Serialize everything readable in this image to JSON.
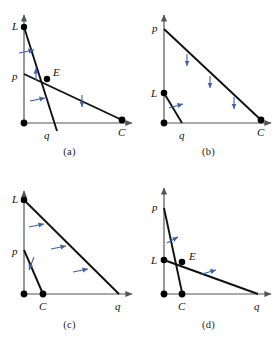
{
  "figure": {
    "type": "geometry-diagram-grid",
    "panel_count": 4,
    "colors": {
      "line": "#111111",
      "axis": "#555555",
      "arrow_marker": "#3f5fa8",
      "point": "#000000",
      "background": "#ffffff"
    }
  },
  "panels": [
    {
      "id": "a",
      "caption": "(a)",
      "labels": {
        "L": "L",
        "p": "p",
        "E": "E",
        "q": "q",
        "C": "C"
      },
      "points": [
        {
          "name": "origin",
          "x": 24,
          "y": 123
        },
        {
          "name": "L",
          "x": 24,
          "y": 27
        },
        {
          "name": "E",
          "x": 47,
          "y": 79
        },
        {
          "name": "C",
          "x": 122,
          "y": 120
        }
      ],
      "segments": [
        {
          "name": "L-q",
          "from": "L",
          "to": "q"
        },
        {
          "name": "p-C",
          "from": "p",
          "to": "C"
        }
      ],
      "axis": {
        "vertical": true,
        "horizontal": true
      },
      "marker_count": 4
    },
    {
      "id": "b",
      "caption": "(b)",
      "labels": {
        "p": "p",
        "L": "L",
        "q": "q",
        "C": "C"
      },
      "points": [
        {
          "name": "origin",
          "x": 25,
          "y": 123
        },
        {
          "name": "L",
          "x": 25,
          "y": 93
        },
        {
          "name": "C",
          "x": 122,
          "y": 120
        }
      ],
      "segments": [
        {
          "name": "p-C",
          "from": "p",
          "to": "C"
        },
        {
          "name": "L-q",
          "from": "L",
          "to": "q"
        }
      ],
      "axis": {
        "vertical": true,
        "horizontal": true
      },
      "marker_count": 4
    },
    {
      "id": "c",
      "caption": "(c)",
      "labels": {
        "L": "L",
        "p": "p",
        "C": "C",
        "q": "q"
      },
      "points": [
        {
          "name": "origin",
          "x": 24,
          "y": 121
        },
        {
          "name": "L",
          "x": 24,
          "y": 27
        },
        {
          "name": "C",
          "x": 43,
          "y": 121
        }
      ],
      "segments": [
        {
          "name": "L-q",
          "from": "L",
          "to": "q"
        },
        {
          "name": "p-C",
          "from": "p",
          "to": "C"
        }
      ],
      "axis": {
        "vertical": true,
        "horizontal": true
      },
      "marker_count": 4
    },
    {
      "id": "d",
      "caption": "(d)",
      "labels": {
        "p": "p",
        "L": "L",
        "E": "E",
        "C": "C",
        "q": "q"
      },
      "points": [
        {
          "name": "origin",
          "x": 25,
          "y": 121
        },
        {
          "name": "L",
          "x": 25,
          "y": 87
        },
        {
          "name": "E",
          "x": 43,
          "y": 89
        },
        {
          "name": "C",
          "x": 43,
          "y": 121
        }
      ],
      "segments": [
        {
          "name": "p-C",
          "from": "p",
          "to": "C"
        },
        {
          "name": "L-q",
          "from": "L",
          "to": "q"
        }
      ],
      "axis": {
        "vertical": true,
        "horizontal": true
      },
      "marker_count": 2
    }
  ]
}
